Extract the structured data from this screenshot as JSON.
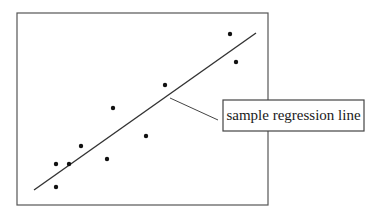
{
  "chart_data": {
    "type": "scatter",
    "title": "",
    "xlabel": "",
    "ylabel": "",
    "grid": false,
    "axes_ticks": false,
    "frame": {
      "x1": 17,
      "y1": 13,
      "x2": 268,
      "y2": 205,
      "color": "#555555"
    },
    "points_px": [
      {
        "x": 230,
        "y": 34
      },
      {
        "x": 236,
        "y": 62
      },
      {
        "x": 165,
        "y": 85
      },
      {
        "x": 113,
        "y": 108
      },
      {
        "x": 146,
        "y": 136
      },
      {
        "x": 81,
        "y": 146
      },
      {
        "x": 56,
        "y": 164
      },
      {
        "x": 69,
        "y": 164
      },
      {
        "x": 107,
        "y": 159
      },
      {
        "x": 56,
        "y": 187
      }
    ],
    "regression_line_px": {
      "x1": 34,
      "y1": 190,
      "x2": 256,
      "y2": 33
    },
    "annotations": [
      {
        "text": "sample regression line",
        "box": {
          "x": 223,
          "y": 100,
          "w": 141,
          "h": 31
        },
        "leader": {
          "x1": 170,
          "y1": 98,
          "x2": 218,
          "y2": 120
        }
      }
    ],
    "colors": {
      "points": "#111111",
      "line": "#333333",
      "frame": "#555555",
      "callout_border": "#444444"
    }
  },
  "callout": {
    "label": "sample regression line"
  }
}
